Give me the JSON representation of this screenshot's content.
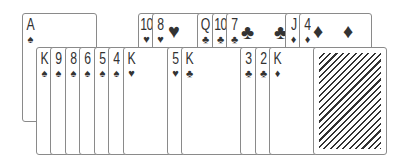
{
  "game": {
    "name": "Solitaire",
    "colors": {
      "card_border": "#8a8a8a",
      "ink": "#333333",
      "background": "#ffffff"
    }
  },
  "cards": {
    "ace_spades": {
      "rank": "A",
      "suit": "♠"
    },
    "k_spades": {
      "rank": "K",
      "suit": "♠"
    },
    "9_spades": {
      "rank": "9",
      "suit": "♠"
    },
    "8_spades": {
      "rank": "8",
      "suit": "♠"
    },
    "6_spades": {
      "rank": "6",
      "suit": "♠"
    },
    "5_spades": {
      "rank": "5",
      "suit": "♠"
    },
    "4_spades": {
      "rank": "4",
      "suit": "♠"
    },
    "k_hearts": {
      "rank": "K",
      "suit": "♥"
    },
    "10_hearts": {
      "rank": "10",
      "suit": "♥"
    },
    "8_hearts": {
      "rank": "8",
      "suit": "♥"
    },
    "5_hearts": {
      "rank": "5",
      "suit": "♥"
    },
    "k_clubs": {
      "rank": "K",
      "suit": "♣"
    },
    "q_clubs": {
      "rank": "Q",
      "suit": "♣"
    },
    "10_clubs": {
      "rank": "10",
      "suit": "♣"
    },
    "7_clubs": {
      "rank": "7",
      "suit": "♣"
    },
    "3_clubs": {
      "rank": "3",
      "suit": "♣"
    },
    "2_clubs": {
      "rank": "2",
      "suit": "♣"
    },
    "k_diamonds": {
      "rank": "K",
      "suit": "♦"
    },
    "j_diamonds": {
      "rank": "J",
      "suit": "♦"
    },
    "4_diamonds": {
      "rank": "4",
      "suit": "♦"
    }
  },
  "pips": {
    "heart": "♥",
    "club": "♣",
    "diamond": "♦"
  },
  "deck": {
    "face_down": true
  }
}
